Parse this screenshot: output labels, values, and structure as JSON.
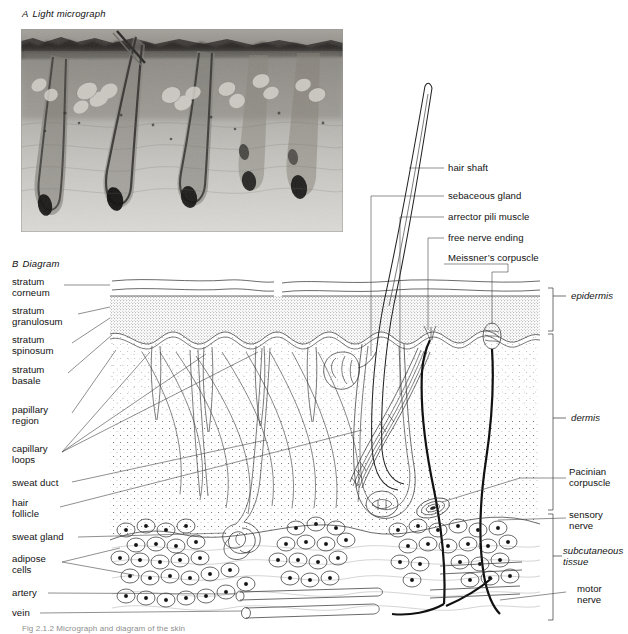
{
  "figure": {
    "panel_a": {
      "letter": "A",
      "title": "Light micrograph"
    },
    "panel_b": {
      "letter": "B",
      "title": "Diagram"
    },
    "caption": "Fig 2.1.2  Micrograph and diagram of the skin"
  },
  "labels_left": [
    {
      "id": "stratum-corneum",
      "text": "stratum\ncorneum",
      "x": 12,
      "y": 281
    },
    {
      "id": "stratum-granulosum",
      "text": "stratum\ngranulosum",
      "x": 12,
      "y": 309
    },
    {
      "id": "stratum-spinosum",
      "text": "stratum\nspinosum",
      "x": 12,
      "y": 338
    },
    {
      "id": "stratum-basale",
      "text": "stratum\nbasale",
      "x": 12,
      "y": 368
    },
    {
      "id": "papillary-region",
      "text": "papillary\nregion",
      "x": 12,
      "y": 408
    },
    {
      "id": "capillary-loops",
      "text": "capillary\nloops",
      "x": 12,
      "y": 447
    },
    {
      "id": "sweat-duct",
      "text": "sweat duct",
      "x": 12,
      "y": 482
    },
    {
      "id": "hair-follicle",
      "text": "hair\nfollicle",
      "x": 12,
      "y": 501
    },
    {
      "id": "sweat-gland",
      "text": "sweat gland",
      "x": 12,
      "y": 536
    },
    {
      "id": "adipose-cells",
      "text": "adipose\ncells",
      "x": 12,
      "y": 557
    },
    {
      "id": "artery",
      "text": "artery",
      "x": 12,
      "y": 591
    },
    {
      "id": "vein",
      "text": "vein",
      "x": 12,
      "y": 611
    }
  ],
  "labels_top_right": [
    {
      "id": "hair-shaft",
      "text": "hair shaft",
      "x": 448,
      "y": 165
    },
    {
      "id": "sebaceous-gland",
      "text": "sebaceous gland",
      "x": 448,
      "y": 193
    },
    {
      "id": "arrector-pili-muscle",
      "text": "arrector pili muscle",
      "x": 448,
      "y": 214
    },
    {
      "id": "free-nerve-ending",
      "text": "free nerve ending",
      "x": 448,
      "y": 235
    },
    {
      "id": "meissners-corpuscle",
      "text": "Meissner’s corpuscle",
      "x": 448,
      "y": 255
    }
  ],
  "labels_right": [
    {
      "id": "epidermis",
      "text": "epidermis",
      "x": 582,
      "y": 293,
      "italic": true
    },
    {
      "id": "dermis",
      "text": "dermis",
      "x": 582,
      "y": 415,
      "italic": true
    },
    {
      "id": "pacinian-corpuscle",
      "text": "Pacinian\ncorpuscle",
      "x": 570,
      "y": 470,
      "italic": false
    },
    {
      "id": "sensory-nerve",
      "text": "sensory\nnerve",
      "x": 570,
      "y": 513,
      "italic": false
    },
    {
      "id": "subcutaneous-tissue",
      "text": "subcutaneous\ntissue",
      "x": 563,
      "y": 548,
      "italic": true
    },
    {
      "id": "motor-nerve",
      "text": "motor\nnerve",
      "x": 578,
      "y": 586,
      "italic": false
    }
  ],
  "diagram_regions": {
    "epidermis_bracket": {
      "top": 288,
      "bottom": 331
    },
    "dermis_bracket": {
      "top": 333,
      "bottom": 508
    },
    "subcutaneous_bracket": {
      "top": 512,
      "bottom": 620
    }
  },
  "colors": {
    "ink": "#1a1a1a",
    "line": "#2b2b2b",
    "leader": "#444444",
    "micrograph_base": "#b9b7b2",
    "caption": "#8d8d8d",
    "page": "#ffffff"
  }
}
